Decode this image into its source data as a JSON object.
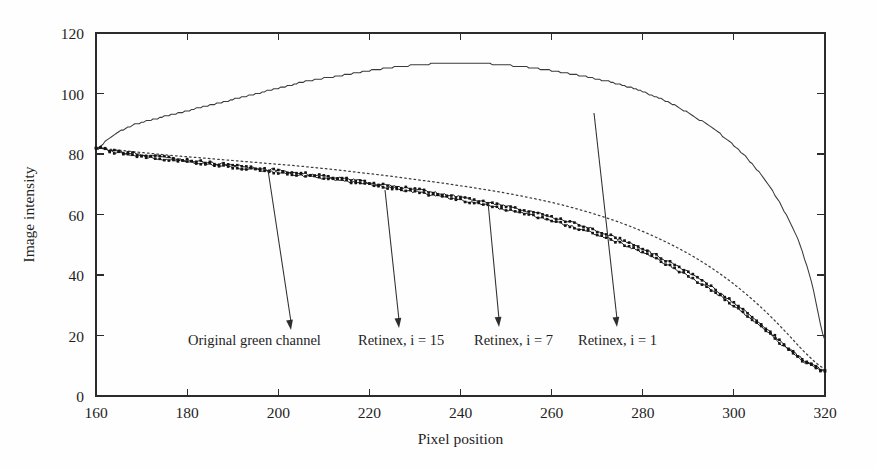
{
  "chart_data": {
    "type": "line",
    "title": "",
    "subtitle": "",
    "xlabel": "Pixel position",
    "ylabel": "Image intensity",
    "xlim": [
      160,
      320
    ],
    "ylim": [
      0,
      120
    ],
    "xticks": [
      160,
      180,
      200,
      220,
      240,
      260,
      280,
      300,
      320
    ],
    "yticks": [
      0,
      20,
      40,
      60,
      80,
      100,
      120
    ],
    "grid": false,
    "legend_position": "none",
    "annotations_note": "Four curves labelled by leader-line arrows pointing from text captions up to each curve",
    "series": [
      {
        "name": "Retinex, i = 1",
        "style": "solid",
        "x": [
          160,
          162,
          164,
          166,
          168,
          170,
          174,
          178,
          182,
          186,
          190,
          194,
          198,
          202,
          206,
          210,
          214,
          218,
          222,
          226,
          230,
          234,
          238,
          242,
          246,
          250,
          254,
          258,
          262,
          266,
          270,
          274,
          278,
          282,
          286,
          290,
          294,
          298,
          302,
          306,
          310,
          314,
          317,
          320
        ],
        "values": [
          82,
          84,
          86.5,
          88,
          89.5,
          90.5,
          92,
          93.5,
          95,
          96.5,
          98,
          99.5,
          101,
          102.5,
          104,
          105,
          106,
          107,
          108,
          108.8,
          109.4,
          109.8,
          110,
          110,
          109.8,
          109.4,
          108.8,
          108,
          107,
          106,
          104.8,
          103.4,
          101.6,
          99.4,
          96.8,
          93.6,
          89.8,
          85.4,
          80,
          73,
          64,
          52,
          38,
          18.5
        ]
      },
      {
        "name": "Retinex, i = 7",
        "style": "dotted",
        "x": [
          160,
          164,
          168,
          172,
          176,
          180,
          184,
          188,
          192,
          196,
          200,
          204,
          208,
          212,
          216,
          220,
          224,
          228,
          232,
          236,
          240,
          244,
          248,
          252,
          256,
          260,
          264,
          268,
          272,
          276,
          280,
          284,
          288,
          292,
          296,
          300,
          304,
          308,
          312,
          316,
          320
        ],
        "values": [
          82,
          81.4,
          80.8,
          80.2,
          79.6,
          79.1,
          78.6,
          78.1,
          77.6,
          77.1,
          76.6,
          76.1,
          75.5,
          74.9,
          74.2,
          73.5,
          72.8,
          72.0,
          71.2,
          70.4,
          69.5,
          68.6,
          67.6,
          66.5,
          65.3,
          64.0,
          62.5,
          60.8,
          58.9,
          56.8,
          54.4,
          51.7,
          48.7,
          45.3,
          41.4,
          37.0,
          32.0,
          26.4,
          20.2,
          13.8,
          9.0
        ]
      },
      {
        "name": "Retinex, i = 15",
        "style": "markers",
        "x": [
          160,
          164,
          168,
          172,
          176,
          180,
          184,
          188,
          192,
          196,
          200,
          204,
          208,
          212,
          216,
          220,
          224,
          228,
          232,
          236,
          240,
          244,
          248,
          252,
          256,
          260,
          264,
          268,
          272,
          276,
          280,
          284,
          288,
          292,
          296,
          300,
          304,
          308,
          312,
          316,
          320
        ],
        "values": [
          82,
          81.0,
          80.2,
          79.4,
          78.7,
          78.0,
          77.3,
          76.6,
          75.9,
          75.2,
          74.5,
          73.8,
          73.1,
          72.3,
          71.5,
          70.6,
          69.7,
          68.8,
          67.8,
          66.8,
          65.7,
          64.6,
          63.4,
          62.1,
          60.7,
          59.2,
          57.5,
          55.6,
          53.5,
          51.2,
          48.6,
          45.7,
          42.5,
          39.0,
          35.1,
          30.8,
          26.1,
          21.0,
          15.8,
          11.2,
          8.5
        ]
      },
      {
        "name": "Original green channel",
        "style": "markers",
        "x": [
          160,
          164,
          168,
          172,
          176,
          180,
          184,
          188,
          192,
          196,
          200,
          204,
          208,
          212,
          216,
          220,
          224,
          228,
          232,
          236,
          240,
          244,
          248,
          252,
          256,
          260,
          264,
          268,
          272,
          276,
          280,
          284,
          288,
          292,
          296,
          300,
          304,
          308,
          312,
          316,
          320
        ],
        "values": [
          82,
          80.6,
          79.6,
          78.8,
          78.1,
          77.4,
          76.7,
          76.0,
          75.3,
          74.6,
          73.9,
          73.2,
          72.4,
          71.6,
          70.8,
          69.9,
          69.0,
          68.0,
          67.0,
          65.9,
          64.8,
          63.6,
          62.3,
          61.0,
          59.6,
          58.0,
          56.3,
          54.4,
          52.3,
          50.0,
          47.4,
          44.5,
          41.3,
          37.8,
          34.0,
          29.8,
          25.2,
          20.3,
          15.2,
          10.8,
          8.2
        ]
      }
    ],
    "annotations": [
      {
        "label": "Original green channel",
        "target_x": 200,
        "target_y": 74
      },
      {
        "label": "Retinex, i = 15",
        "target_x": 226,
        "target_y": 68
      },
      {
        "label": "Retinex, i = 7",
        "target_x": 248,
        "target_y": 62
      },
      {
        "label": "Retinex, i = 1",
        "target_x": 269,
        "target_y": 105
      }
    ]
  },
  "axes": {
    "y_title": "Image intensity",
    "x_title": "Pixel position",
    "y_tick_labels": [
      "0",
      "20",
      "40",
      "60",
      "80",
      "100",
      "120"
    ],
    "x_tick_labels": [
      "160",
      "180",
      "200",
      "220",
      "240",
      "260",
      "280",
      "300",
      "320"
    ]
  },
  "annotation_labels": {
    "original": "Original green channel",
    "retinex15": "Retinex, i = 15",
    "retinex7": "Retinex, i = 7",
    "retinex1": "Retinex, i = 1"
  },
  "colors": {
    "ink": "#1f1f1f",
    "curve": "#3a3a3a",
    "marker": "#141414",
    "background": "#fefefe"
  }
}
